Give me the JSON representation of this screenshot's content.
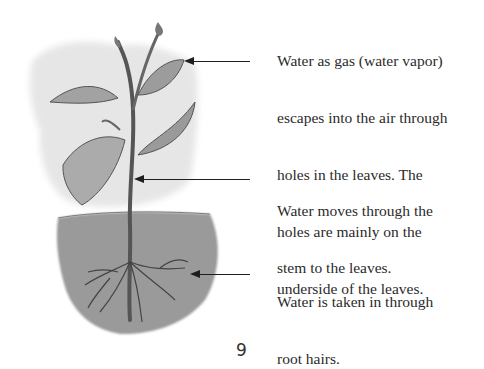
{
  "illustration": {
    "subject": "plant with roots in soil",
    "style": "grayscale watercolor"
  },
  "labels": [
    {
      "id": "leaves",
      "lines": [
        "Water as gas (water vapor)",
        "escapes into the air through",
        "holes in the leaves. The",
        "holes are mainly on the",
        "underside of the leaves."
      ]
    },
    {
      "id": "stem",
      "lines": [
        "Water moves through the",
        "stem to the leaves."
      ]
    },
    {
      "id": "roots",
      "lines": [
        "Water is taken in through",
        "root hairs."
      ]
    }
  ],
  "page_number": "9"
}
